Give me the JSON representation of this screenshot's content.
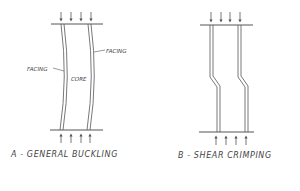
{
  "diagram_a": {
    "caption": "A - GENERAL BUCKLING",
    "facing_left_label": "FACING",
    "facing_right_label": "FACING",
    "core_label": "CORE"
  },
  "diagram_b": {
    "caption": "B - SHEAR CRIMPING"
  },
  "colors": {
    "line": "#555555",
    "text": "#444444",
    "background": "#ffffff"
  }
}
